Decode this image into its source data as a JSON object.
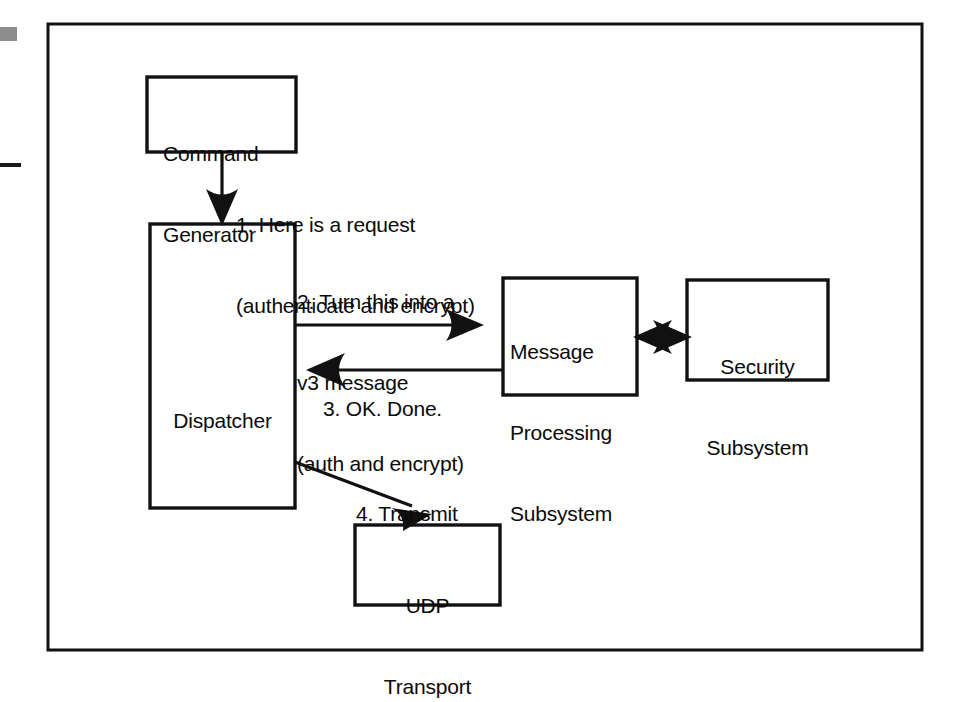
{
  "figure": {
    "kind": "block-diagram",
    "frame": {
      "name": "figure-border",
      "x": 48,
      "y": 24,
      "width": 874,
      "height": 626,
      "stroke": "#111111",
      "stroke_width": 3,
      "fill": "#ffffff"
    },
    "page_marks": {
      "gray_block": {
        "x": 0,
        "y": 27,
        "width": 17,
        "height": 14,
        "color": "#8d8d8d"
      },
      "left_rule": {
        "x": 0,
        "y": 163,
        "width": 21,
        "height": 4,
        "color": "#1a1a1a"
      }
    },
    "colors": {
      "ink": "#111111",
      "paper": "#ffffff",
      "page_mark_gray": "#8d8d8d"
    }
  },
  "boxes": [
    {
      "id": "command-generator",
      "name": "box-command-generator",
      "lines": [
        "Command",
        "Generator"
      ],
      "x": 147,
      "y": 77,
      "width": 149,
      "height": 75,
      "align": "left",
      "text_x": 163,
      "text_y": 88
    },
    {
      "id": "dispatcher",
      "name": "box-dispatcher",
      "lines": [
        "Dispatcher"
      ],
      "x": 150,
      "y": 224,
      "width": 145,
      "height": 284,
      "align": "center",
      "text_x": 150,
      "text_y": 324
    },
    {
      "id": "message-processing-subsystem",
      "name": "box-message-processing-subsystem",
      "lines": [
        "Message",
        "Processing",
        "Subsystem"
      ],
      "x": 503,
      "y": 278,
      "width": 134,
      "height": 117,
      "align": "left",
      "text_x": 512,
      "text_y": 285
    },
    {
      "id": "security-subsystem",
      "name": "box-security-subsystem",
      "lines": [
        "Security",
        "Subsystem"
      ],
      "x": 687,
      "y": 280,
      "width": 141,
      "height": 100,
      "align": "center",
      "text_x": 687,
      "text_y": 300
    },
    {
      "id": "udp-transport",
      "name": "box-udp-transport",
      "lines": [
        "UDP",
        "Transport"
      ],
      "x": 355,
      "y": 525,
      "width": 145,
      "height": 80,
      "align": "center",
      "text_x": 355,
      "text_y": 538
    }
  ],
  "steps": [
    {
      "id": "step-1",
      "name": "label-step-1",
      "number": "1.",
      "lines": [
        "1. Here is a request",
        "(authenticate and encrypt)"
      ],
      "x": 236,
      "y": 157,
      "from": "command-generator",
      "to": "dispatcher"
    },
    {
      "id": "step-2",
      "name": "label-step-2",
      "number": "2.",
      "lines": [
        "2. Turn this into a",
        "v3 message",
        "(auth and encrypt)"
      ],
      "x": 297,
      "y": 234,
      "from": "dispatcher",
      "to": "message-processing-subsystem"
    },
    {
      "id": "step-3",
      "name": "label-step-3",
      "number": "3.",
      "lines": [
        "3. OK. Done."
      ],
      "x": 323,
      "y": 341,
      "from": "message-processing-subsystem",
      "to": "dispatcher"
    },
    {
      "id": "step-4",
      "name": "label-step-4",
      "number": "4.",
      "lines": [
        "4. Transmit"
      ],
      "x": 356,
      "y": 446,
      "from": "dispatcher",
      "to": "udp-transport"
    }
  ],
  "connectors": [
    {
      "id": "arrow-cg-to-dispatcher",
      "name": "arrow-command-generator-to-dispatcher",
      "type": "straight",
      "points": "222,152 222,218",
      "head_at": "222,224",
      "direction": "down",
      "step": "1"
    },
    {
      "id": "arrow-dispatcher-to-mps",
      "name": "arrow-dispatcher-to-message-processing",
      "type": "straight",
      "points": "295,325 472,325",
      "head_at": "480,325",
      "direction": "right",
      "step": "2"
    },
    {
      "id": "arrow-mps-to-dispatcher",
      "name": "arrow-message-processing-to-dispatcher",
      "type": "straight",
      "points": "503,370 318,370",
      "head_at": "308,370",
      "direction": "left",
      "step": "3"
    },
    {
      "id": "arrow-dispatcher-to-udp",
      "name": "arrow-dispatcher-to-udp-transport",
      "type": "diagonal",
      "points": "295,462 418,508",
      "head_at": "428,512",
      "direction": "down-right",
      "step": "4"
    },
    {
      "id": "arrow-mps-security-bidirectional",
      "name": "arrow-message-processing-security-bidirectional",
      "type": "double",
      "points": "637,337 687,337",
      "head_at": "637,337 and 687,337",
      "direction": "both",
      "step": ""
    }
  ]
}
